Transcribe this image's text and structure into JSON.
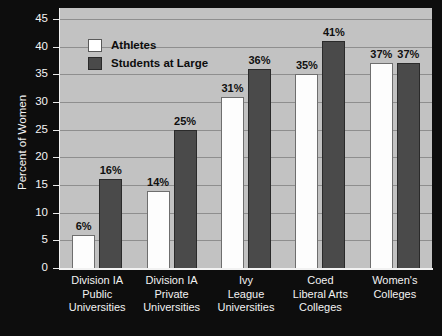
{
  "chart_data": {
    "type": "bar",
    "title": "",
    "subtitle": "",
    "xlabel": "",
    "ylabel": "Percent of Women",
    "ylim": [
      0,
      47
    ],
    "yticks": [
      0,
      5,
      10,
      15,
      20,
      25,
      30,
      35,
      40,
      45
    ],
    "ytick_labels": [
      "0",
      "5",
      "10",
      "15",
      "20",
      "25",
      "30",
      "35",
      "40",
      "45"
    ],
    "grid": true,
    "grid_axis": "y",
    "legend_position": "upper left inside",
    "categories": [
      "Division IA\nPublic\nUniversities",
      "Division IA\nPrivate\nUniversities",
      "Ivy\nLeague\nUniversities",
      "Coed\nLiberal Arts\nColleges",
      "Women's\nColleges"
    ],
    "series": [
      {
        "name": "Athletes",
        "color": "#ffffff",
        "values": [
          6,
          14,
          31,
          35,
          37
        ],
        "labels": [
          "6%",
          "14%",
          "31%",
          "35%",
          "37%"
        ]
      },
      {
        "name": "Students at Large",
        "color": "#4a4a4a",
        "values": [
          16,
          25,
          36,
          41,
          37
        ],
        "labels": [
          "16%",
          "25%",
          "36%",
          "41%",
          "37%"
        ]
      }
    ],
    "colors": {
      "plot_background": "#c2c2c2",
      "figure_background": "#0d0d0d",
      "gridline": "#8e8e8e",
      "axis": "#f2f2f2",
      "tick_text": "#f4f4f4",
      "value_label_text": "#101010"
    }
  }
}
